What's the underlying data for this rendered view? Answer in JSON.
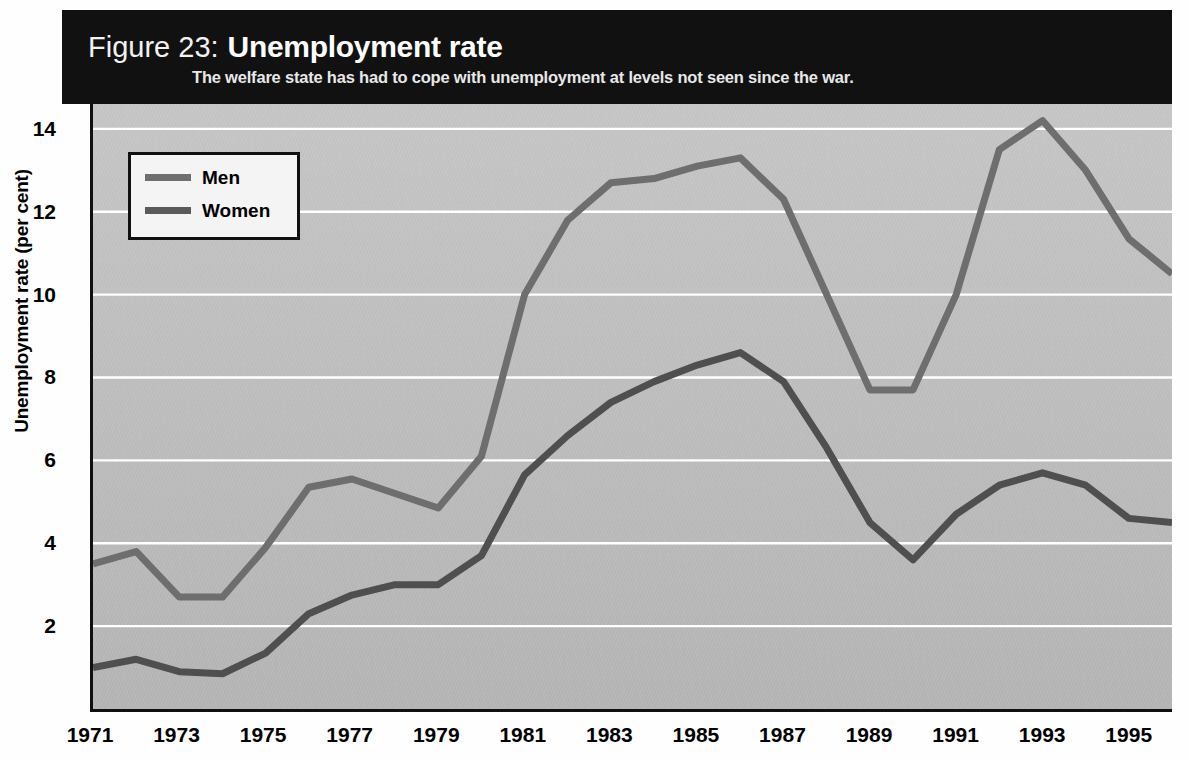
{
  "header": {
    "figure_number": "Figure 23:",
    "title": "Unemployment rate",
    "subtitle": "The welfare state has had to cope with unemployment at levels not seen since the war."
  },
  "legend": {
    "position": "top-left-inside",
    "items": [
      {
        "label": "Men",
        "color": "#6e6e6e"
      },
      {
        "label": "Women",
        "color": "#5a5a5a"
      }
    ]
  },
  "colors": {
    "header_band": "#111111",
    "plot_background": "#bcbcbc",
    "gridline": "#ffffff",
    "axis": "#101010",
    "men_line": "#6e6e6e",
    "women_line": "#4f4f4f",
    "text": "#000000"
  },
  "chart_data": {
    "type": "line",
    "title": "Unemployment rate",
    "subtitle": "The welfare state has had to cope with unemployment at levels not seen since the war.",
    "xlabel": "",
    "ylabel": "Unemployment rate (per cent)",
    "xlim": [
      1971,
      1996
    ],
    "ylim": [
      0,
      14.6
    ],
    "yticks": [
      2,
      4,
      6,
      8,
      10,
      12,
      14
    ],
    "ytick_labels": [
      "2",
      "4",
      "6",
      "8",
      "10",
      "12",
      "14"
    ],
    "xticks": [
      1971,
      1973,
      1975,
      1977,
      1979,
      1981,
      1983,
      1985,
      1987,
      1989,
      1991,
      1993,
      1995
    ],
    "xtick_labels": [
      "1971",
      "1973",
      "1975",
      "1977",
      "1979",
      "1981",
      "1983",
      "1985",
      "1987",
      "1989",
      "1991",
      "1993",
      "1995"
    ],
    "grid": true,
    "grid_axis": "y",
    "legend_position": "upper left",
    "x": [
      1971,
      1972,
      1973,
      1974,
      1975,
      1976,
      1977,
      1978,
      1979,
      1980,
      1981,
      1982,
      1983,
      1984,
      1985,
      1986,
      1987,
      1988,
      1989,
      1990,
      1991,
      1992,
      1993,
      1994,
      1995,
      1996
    ],
    "series": [
      {
        "name": "Men",
        "color": "#6e6e6e",
        "values": [
          3.5,
          3.8,
          2.7,
          2.7,
          3.9,
          5.35,
          5.55,
          5.2,
          4.85,
          6.1,
          10.0,
          11.8,
          12.7,
          12.8,
          13.1,
          13.3,
          12.3,
          10.0,
          7.7,
          7.7,
          10.0,
          13.5,
          14.2,
          13.0,
          11.35,
          10.5
        ]
      },
      {
        "name": "Women",
        "color": "#4f4f4f",
        "values": [
          1.0,
          1.2,
          0.9,
          0.85,
          1.35,
          2.3,
          2.75,
          3.0,
          3.0,
          3.7,
          5.65,
          6.6,
          7.4,
          7.9,
          8.3,
          8.6,
          7.9,
          6.3,
          4.5,
          3.6,
          4.7,
          5.4,
          5.7,
          5.4,
          4.6,
          4.5
        ]
      }
    ]
  }
}
